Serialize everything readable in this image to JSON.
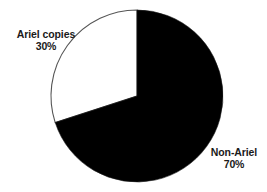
{
  "chart_data": {
    "type": "pie",
    "title": "",
    "subtitle": "",
    "xlabel": "",
    "ylabel": "",
    "grid": false,
    "legend_position": "none",
    "units": "percent",
    "start_angle_deg": 0,
    "direction": "clockwise",
    "categories": [
      "Non-Ariel",
      "Ariel copies"
    ],
    "values": [
      70,
      30
    ],
    "slices": [
      {
        "name": "Non-Ariel",
        "value": 70,
        "value_label": "70%",
        "color": "#000000",
        "stroke": "#1a1a1a",
        "label_position": "outside-bottom-right"
      },
      {
        "name": "Ariel copies",
        "value": 30,
        "value_label": "30%",
        "color": "#ffffff",
        "stroke": "#555555",
        "label_position": "outside-top-left"
      }
    ],
    "annotations": []
  },
  "labels": {
    "ariel": {
      "name": "Ariel copies",
      "value": "30%"
    },
    "non_ariel": {
      "name": "Non-Ariel",
      "value": "70%"
    }
  },
  "colors": {
    "background": "#ffffff",
    "slice_dark": "#000000",
    "slice_light": "#ffffff",
    "outline": "#555555",
    "text": "#1a1a1a"
  }
}
